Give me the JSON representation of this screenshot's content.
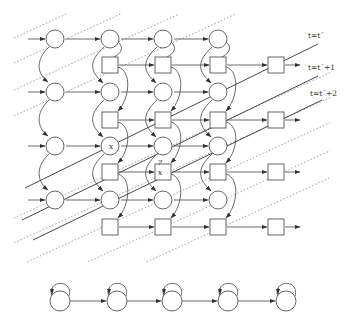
{
  "grid": {
    "columns_x": [
      55,
      110,
      163,
      218,
      276
    ],
    "circle_rows_y": [
      39,
      92,
      146,
      200
    ],
    "square_rows_y": [
      65,
      120,
      172,
      227
    ],
    "circle_radius": 9,
    "square_size": 16
  },
  "time_labels": [
    {
      "text": "t=t´",
      "x": 308,
      "y": 38
    },
    {
      "text": "t=t´+1",
      "x": 308,
      "y": 70
    },
    {
      "text": "t=t´+2",
      "x": 310,
      "y": 96
    }
  ],
  "time_lines": [
    {
      "x1": 25,
      "y1": 188,
      "x2": 318,
      "y2": 44
    },
    {
      "x1": 22,
      "y1": 220,
      "x2": 318,
      "y2": 76
    },
    {
      "x1": 33,
      "y1": 240,
      "x2": 322,
      "y2": 100
    }
  ],
  "marks": [
    {
      "text": "x",
      "x": 111,
      "y": 149,
      "node": "circle c2 r3"
    },
    {
      "text": "x",
      "x": 160,
      "y": 175,
      "node": "square c3 r3"
    },
    {
      "text": "?",
      "x": 160,
      "y": 165,
      "node": "above square c3 r3"
    }
  ],
  "bottom_chain": {
    "y": 301,
    "radius": 10,
    "centers_x": [
      60,
      117,
      172,
      228,
      286
    ]
  },
  "colors": {
    "stroke": "#444444",
    "dashed": "#777777",
    "background": "#ffffff"
  }
}
